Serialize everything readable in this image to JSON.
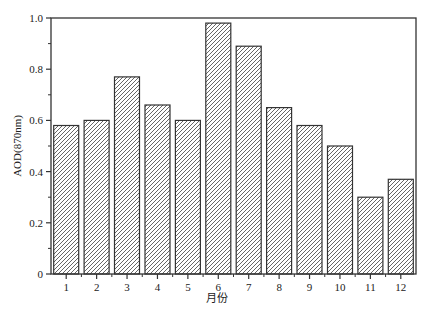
{
  "chart_data": {
    "type": "bar",
    "title": "",
    "xlabel": "月份",
    "ylabel": "AOD(870nm)",
    "categories": [
      "1",
      "2",
      "3",
      "4",
      "5",
      "6",
      "7",
      "8",
      "9",
      "10",
      "11",
      "12"
    ],
    "values": [
      0.58,
      0.6,
      0.77,
      0.66,
      0.6,
      0.98,
      0.89,
      0.65,
      0.58,
      0.5,
      0.3,
      0.37
    ],
    "ylim": [
      0,
      1.0
    ],
    "yticks": [
      0,
      0.2,
      0.4,
      0.6,
      0.8,
      1.0
    ],
    "ytick_labels": [
      "0",
      "0.2",
      "0.4",
      "0.6",
      "0.8",
      "1.0"
    ],
    "grid": false,
    "legend": null,
    "bar_style": "diagonal-hatch",
    "colors": {
      "bar_fill": "#ffffff",
      "hatch": "#555555",
      "bar_edge": "#333333",
      "axis": "#333333"
    }
  }
}
